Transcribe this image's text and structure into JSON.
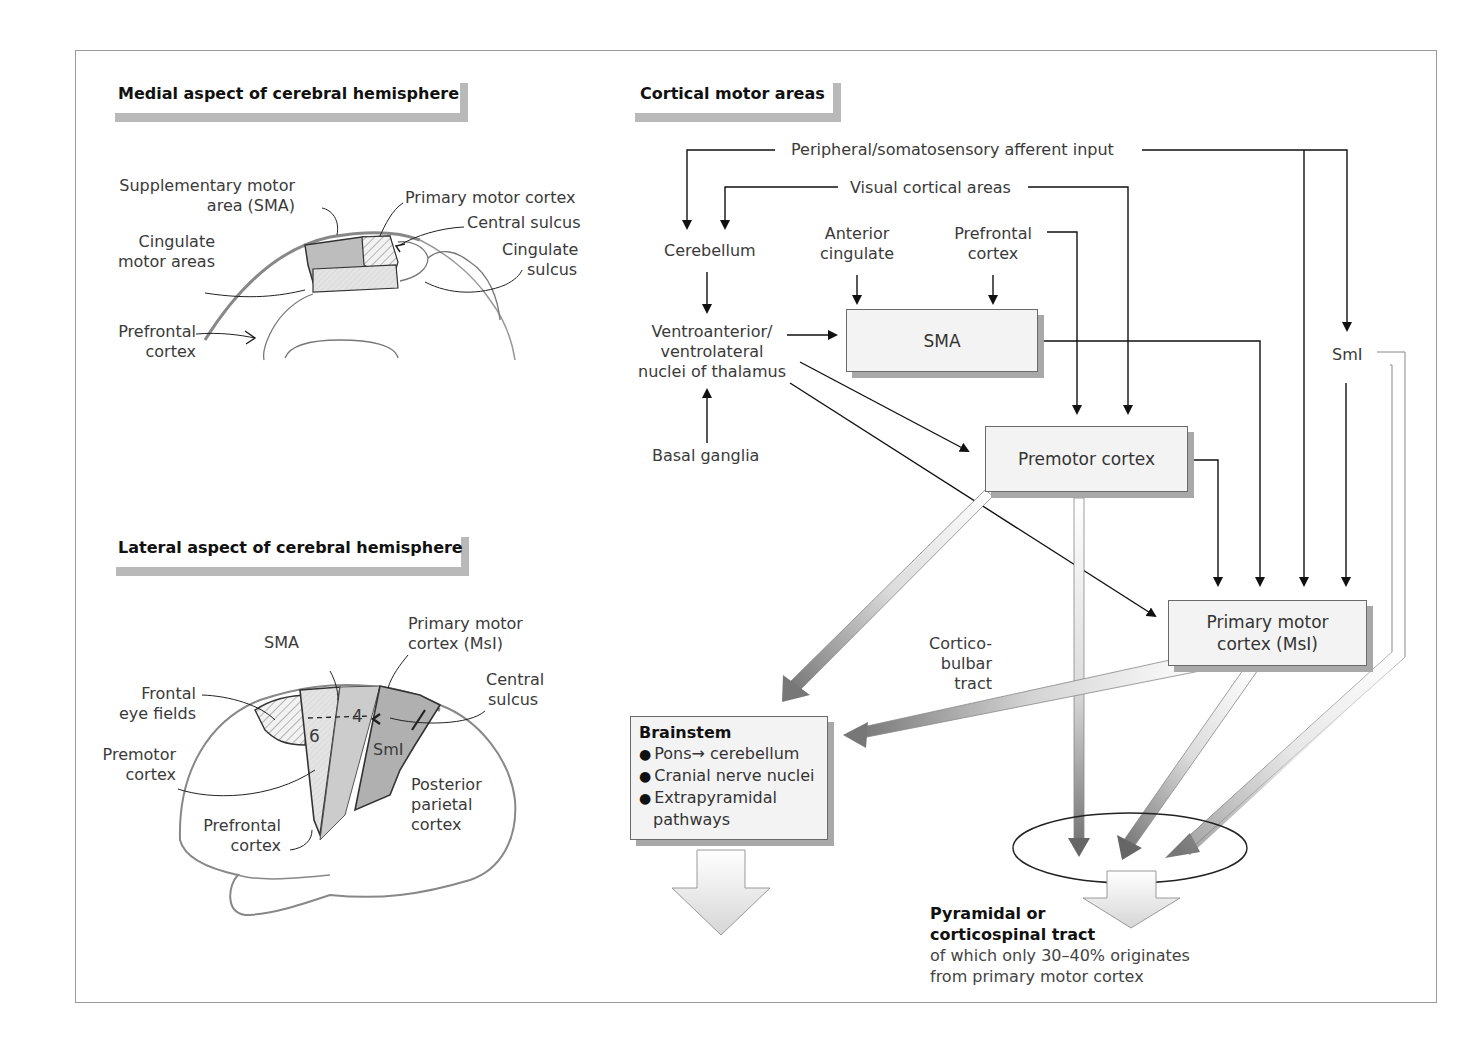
{
  "panels": {
    "medial": {
      "heading": "Medial aspect of cerebral hemisphere",
      "labels": {
        "sma_line1": "Supplementary motor",
        "sma_line2": "area (SMA)",
        "primary_motor": "Primary motor cortex",
        "central_sulcus": "Central sulcus",
        "cingulate_motor_line1": "Cingulate",
        "cingulate_motor_line2": "motor areas",
        "cingulate_sulcus_line1": "Cingulate",
        "cingulate_sulcus_line2": "sulcus",
        "prefrontal_line1": "Prefrontal",
        "prefrontal_line2": "cortex"
      }
    },
    "lateral": {
      "heading": "Lateral aspect of cerebral hemisphere",
      "labels": {
        "sma": "SMA",
        "primary_motor_line1": "Primary motor",
        "primary_motor_line2": "cortex (MsI)",
        "central_sulcus_line1": "Central",
        "central_sulcus_line2": "sulcus",
        "frontal_eye_line1": "Frontal",
        "frontal_eye_line2": "eye fields",
        "premotor_line1": "Premotor",
        "premotor_line2": "cortex",
        "area6": "6",
        "area4": "4",
        "smi": "SmI",
        "prefrontal_line1": "Prefrontal",
        "prefrontal_line2": "cortex",
        "posterior_line1": "Posterior",
        "posterior_line2": "parietal",
        "posterior_line3": "cortex"
      }
    },
    "cortical": {
      "heading": "Cortical motor areas",
      "inputs": {
        "peripheral": "Peripheral/somatosensory afferent input",
        "visual": "Visual cortical areas",
        "cerebellum": "Cerebellum",
        "anterior_cingulate_line1": "Anterior",
        "anterior_cingulate_line2": "cingulate",
        "prefrontal_line1": "Prefrontal",
        "prefrontal_line2": "cortex",
        "thalamus_line1": "Ventroanterior/",
        "thalamus_line2": "ventrolateral",
        "thalamus_line3": "nuclei of thalamus",
        "basal_ganglia": "Basal ganglia",
        "smi": "SmI"
      },
      "boxes": {
        "sma": "SMA",
        "premotor": "Premotor cortex",
        "primary_line1": "Primary motor",
        "primary_line2": "cortex (MsI)"
      },
      "corticobulbar_line1": "Cortico-",
      "corticobulbar_line2": "bulbar",
      "corticobulbar_line3": "tract",
      "brainstem": {
        "title": "Brainstem",
        "bullet": "●",
        "items": [
          "Pons→ cerebellum",
          "Cranial nerve nuclei",
          "Extrapyramidal",
          "pathways"
        ]
      },
      "pyramidal": {
        "title_line1": "Pyramidal or",
        "title_line2": "corticospinal tract",
        "sub_line1": "of which only 30–40% originates",
        "sub_line2": "from primary motor cortex"
      }
    }
  },
  "colors": {
    "outline": "#888888",
    "line": "#222222",
    "box_fill": "#f3f3f3",
    "box_shadow": "#a8a8a8",
    "heading_bar": "#b9b9b9",
    "region_dark": "#b4b4b4",
    "region_mid": "#cfcfcf",
    "region_light": "#e6e6e6"
  }
}
